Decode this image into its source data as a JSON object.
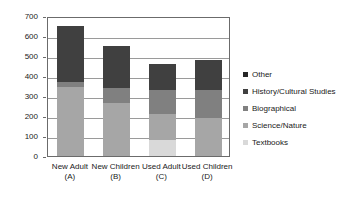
{
  "chart_data": {
    "type": "bar",
    "subtype": "stacked-column",
    "title": "",
    "xlabel": "",
    "ylabel": "",
    "ylim": [
      0,
      700
    ],
    "ytick_step": 100,
    "yticks": [
      "700",
      "600",
      "500",
      "400",
      "300",
      "200",
      "100",
      "0"
    ],
    "grid": true,
    "legend_position": "right",
    "categories": [
      {
        "line1": "New Adult",
        "line2": "(A)"
      },
      {
        "line1": "New Children",
        "line2": "(B)"
      },
      {
        "line1": "Used Adult",
        "line2": "(C)"
      },
      {
        "line1": "Used Children",
        "line2": "(D)"
      }
    ],
    "category_labels": [
      "New Adult (A)",
      "New Children (B)",
      "Used Adult (C)",
      "Used Children (D)"
    ],
    "series": [
      {
        "name": "Textbooks",
        "color": "#d9d9d9",
        "values": [
          0,
          0,
          80,
          0
        ]
      },
      {
        "name": "Science/Nature",
        "color": "#a6a6a6",
        "values": [
          345,
          265,
          130,
          190
        ]
      },
      {
        "name": "Biographical",
        "color": "#808080",
        "values": [
          25,
          75,
          120,
          140
        ]
      },
      {
        "name": "History/Cultural Studies",
        "color": "#404040",
        "values": [
          280,
          210,
          130,
          150
        ]
      },
      {
        "name": "Other",
        "color": "#262626",
        "values": [
          0,
          0,
          0,
          0
        ]
      }
    ],
    "totals": [
      650,
      550,
      460,
      480
    ],
    "legend_order": [
      "Other",
      "History/Cultural Studies",
      "Biographical",
      "Science/Nature",
      "Textbooks"
    ]
  },
  "colors": {
    "axis": "#6b6b6b",
    "grid": "#9a9a9a",
    "text": "#1a1a1a",
    "background": "#ffffff"
  }
}
